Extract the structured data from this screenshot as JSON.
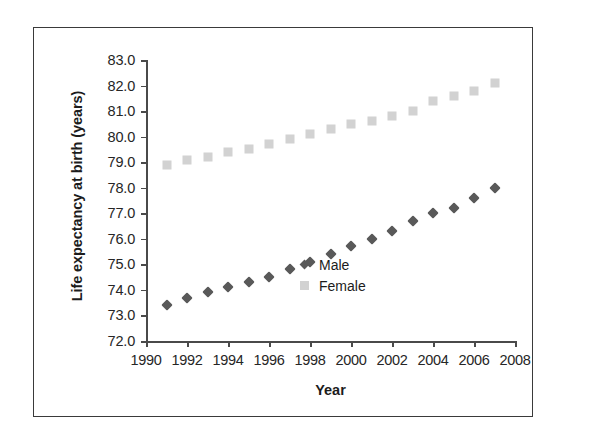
{
  "figure": {
    "border_color": "#3a3a3a",
    "background": "#ffffff"
  },
  "axis_titles": {
    "y": "Life expectancy at birth (years)",
    "x": "Year"
  },
  "legend": {
    "position": "inside-right-lower",
    "entries": [
      {
        "label": "Male",
        "marker": "diamond",
        "color": "#595959"
      },
      {
        "label": "Female",
        "marker": "square",
        "color": "#d2d2d2"
      }
    ]
  },
  "chart_data": {
    "type": "scatter",
    "title": "",
    "subtitle": "",
    "xlabel": "Year",
    "ylabel": "Life expectancy at birth (years)",
    "xlim": [
      1990,
      2008
    ],
    "ylim": [
      72.0,
      83.0
    ],
    "xticks": [
      1990,
      1992,
      1994,
      1996,
      1998,
      2000,
      2002,
      2004,
      2006,
      2008
    ],
    "yticks": [
      72.0,
      73.0,
      74.0,
      75.0,
      76.0,
      77.0,
      78.0,
      79.0,
      80.0,
      81.0,
      82.0,
      83.0
    ],
    "xtick_labels": [
      "1990",
      "1992",
      "1994",
      "1996",
      "1998",
      "2000",
      "2002",
      "2004",
      "2006",
      "2008"
    ],
    "ytick_labels": [
      "72.0",
      "73.0",
      "74.0",
      "75.0",
      "76.0",
      "77.0",
      "78.0",
      "79.0",
      "80.0",
      "81.0",
      "82.0",
      "83.0"
    ],
    "grid": false,
    "legend_entries": [
      "Male",
      "Female"
    ],
    "x": [
      1991,
      1992,
      1993,
      1994,
      1995,
      1996,
      1997,
      1998,
      1999,
      2000,
      2001,
      2002,
      2003,
      2004,
      2005,
      2006,
      2007
    ],
    "series": [
      {
        "name": "Male",
        "marker": "diamond",
        "color": "#595959",
        "values": [
          73.4,
          73.7,
          73.9,
          74.1,
          74.3,
          74.5,
          74.8,
          75.1,
          75.4,
          75.7,
          76.0,
          76.3,
          76.7,
          77.0,
          77.2,
          77.6,
          78.0
        ]
      },
      {
        "name": "Female",
        "marker": "square",
        "color": "#d2d2d2",
        "values": [
          78.9,
          79.1,
          79.2,
          79.4,
          79.5,
          79.7,
          79.9,
          80.1,
          80.3,
          80.5,
          80.6,
          80.8,
          81.0,
          81.4,
          81.6,
          81.8,
          82.1
        ]
      }
    ]
  }
}
